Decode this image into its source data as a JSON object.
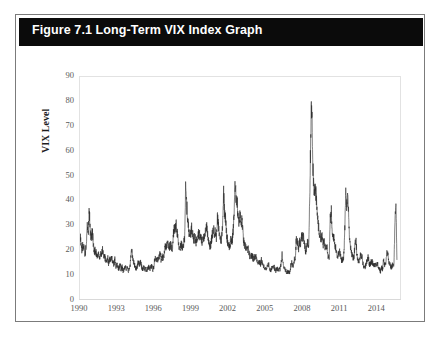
{
  "figure": {
    "title": "Figure 7.1 Long-Term VIX Index Graph",
    "frame_border_color": "#7b7b7b",
    "title_bar_color": "#0b0b0b",
    "title_text_color": "#ffffff",
    "background_color": "#ffffff"
  },
  "chart_data": {
    "type": "line",
    "title": "Figure 7.1 Long-Term VIX Index Graph",
    "xlabel": "",
    "ylabel": "VIX Level",
    "xlim": [
      1990,
      2016
    ],
    "ylim": [
      0,
      90
    ],
    "ytick_labels": [
      "90",
      "80",
      "70",
      "60",
      "50",
      "40",
      "30",
      "20",
      "10",
      "0"
    ],
    "ytick_values": [
      90,
      80,
      70,
      60,
      50,
      40,
      30,
      20,
      10,
      0
    ],
    "xtick_labels": [
      "1990",
      "1993",
      "1996",
      "1999",
      "2002",
      "2005",
      "2008",
      "2011",
      "2014"
    ],
    "xtick_values": [
      1990,
      1993,
      1996,
      1999,
      2002,
      2005,
      2008,
      2011,
      2014
    ],
    "grid": false,
    "legend": null,
    "series_name": "VIX Level",
    "line_color": "#2b2b2b",
    "line_width": 0.6,
    "x": [
      1990.0,
      1990.08,
      1990.17,
      1990.25,
      1990.33,
      1990.42,
      1990.5,
      1990.58,
      1990.67,
      1990.75,
      1990.83,
      1990.92,
      1991.0,
      1991.08,
      1991.17,
      1991.25,
      1991.33,
      1991.42,
      1991.5,
      1991.58,
      1991.67,
      1991.75,
      1991.83,
      1991.92,
      1992.0,
      1992.08,
      1992.17,
      1992.25,
      1992.33,
      1992.42,
      1992.5,
      1992.58,
      1992.67,
      1992.75,
      1992.83,
      1992.92,
      1993.0,
      1993.08,
      1993.17,
      1993.25,
      1993.33,
      1993.42,
      1993.5,
      1993.58,
      1993.67,
      1993.75,
      1993.83,
      1993.92,
      1994.0,
      1994.08,
      1994.17,
      1994.25,
      1994.33,
      1994.42,
      1994.5,
      1994.58,
      1994.67,
      1994.75,
      1994.83,
      1994.92,
      1995.0,
      1995.08,
      1995.17,
      1995.25,
      1995.33,
      1995.42,
      1995.5,
      1995.58,
      1995.67,
      1995.75,
      1995.83,
      1995.92,
      1996.0,
      1996.08,
      1996.17,
      1996.25,
      1996.33,
      1996.42,
      1996.5,
      1996.58,
      1996.67,
      1996.75,
      1996.83,
      1996.92,
      1997.0,
      1997.08,
      1997.17,
      1997.25,
      1997.33,
      1997.42,
      1997.5,
      1997.58,
      1997.67,
      1997.75,
      1997.83,
      1997.92,
      1998.0,
      1998.08,
      1998.17,
      1998.25,
      1998.33,
      1998.42,
      1998.5,
      1998.58,
      1998.67,
      1998.75,
      1998.83,
      1998.92,
      1999.0,
      1999.08,
      1999.17,
      1999.25,
      1999.33,
      1999.42,
      1999.5,
      1999.58,
      1999.67,
      1999.75,
      1999.83,
      1999.92,
      2000.0,
      2000.08,
      2000.17,
      2000.25,
      2000.33,
      2000.42,
      2000.5,
      2000.58,
      2000.67,
      2000.75,
      2000.83,
      2000.92,
      2001.0,
      2001.08,
      2001.17,
      2001.25,
      2001.33,
      2001.42,
      2001.5,
      2001.58,
      2001.67,
      2001.75,
      2001.83,
      2001.92,
      2002.0,
      2002.08,
      2002.17,
      2002.25,
      2002.33,
      2002.42,
      2002.5,
      2002.58,
      2002.67,
      2002.75,
      2002.83,
      2002.92,
      2003.0,
      2003.08,
      2003.17,
      2003.25,
      2003.33,
      2003.42,
      2003.5,
      2003.58,
      2003.67,
      2003.75,
      2003.83,
      2003.92,
      2004.0,
      2004.08,
      2004.17,
      2004.25,
      2004.33,
      2004.42,
      2004.5,
      2004.58,
      2004.67,
      2004.75,
      2004.83,
      2004.92,
      2005.0,
      2005.08,
      2005.17,
      2005.25,
      2005.33,
      2005.42,
      2005.5,
      2005.58,
      2005.67,
      2005.75,
      2005.83,
      2005.92,
      2006.0,
      2006.08,
      2006.17,
      2006.25,
      2006.33,
      2006.42,
      2006.5,
      2006.58,
      2006.67,
      2006.75,
      2006.83,
      2006.92,
      2007.0,
      2007.08,
      2007.17,
      2007.25,
      2007.33,
      2007.42,
      2007.5,
      2007.58,
      2007.67,
      2007.75,
      2007.83,
      2007.92,
      2008.0,
      2008.08,
      2008.17,
      2008.25,
      2008.33,
      2008.42,
      2008.5,
      2008.58,
      2008.67,
      2008.75,
      2008.83,
      2008.92,
      2009.0,
      2009.08,
      2009.17,
      2009.25,
      2009.33,
      2009.42,
      2009.5,
      2009.58,
      2009.67,
      2009.75,
      2009.83,
      2009.92,
      2010.0,
      2010.08,
      2010.17,
      2010.25,
      2010.33,
      2010.42,
      2010.5,
      2010.58,
      2010.67,
      2010.75,
      2010.83,
      2010.92,
      2011.0,
      2011.08,
      2011.17,
      2011.25,
      2011.33,
      2011.42,
      2011.5,
      2011.58,
      2011.67,
      2011.75,
      2011.83,
      2011.92,
      2012.0,
      2012.08,
      2012.17,
      2012.25,
      2012.33,
      2012.42,
      2012.5,
      2012.58,
      2012.67,
      2012.75,
      2012.83,
      2012.92,
      2013.0,
      2013.08,
      2013.17,
      2013.25,
      2013.33,
      2013.42,
      2013.5,
      2013.58,
      2013.67,
      2013.75,
      2013.83,
      2013.92,
      2014.0,
      2014.08,
      2014.17,
      2014.25,
      2014.33,
      2014.42,
      2014.5,
      2014.58,
      2014.67,
      2014.75,
      2014.83,
      2014.92,
      2015.0,
      2015.08,
      2015.17,
      2015.25,
      2015.33,
      2015.42,
      2015.5,
      2015.58,
      2015.67,
      2015.75
    ],
    "values": [
      26,
      22,
      19,
      23,
      20,
      18,
      22,
      30,
      27,
      36,
      28,
      24,
      28,
      22,
      19,
      20,
      18,
      17,
      18,
      16,
      19,
      18,
      20,
      17,
      17,
      16,
      15,
      17,
      14,
      16,
      15,
      17,
      15,
      14,
      16,
      13,
      14,
      13,
      12,
      14,
      12,
      13,
      11,
      12,
      13,
      12,
      13,
      11,
      12,
      14,
      20,
      18,
      15,
      14,
      13,
      12,
      14,
      15,
      14,
      15,
      13,
      12,
      13,
      12,
      12,
      12,
      12,
      13,
      12,
      13,
      13,
      12,
      13,
      17,
      15,
      16,
      16,
      17,
      18,
      16,
      17,
      16,
      18,
      21,
      21,
      22,
      23,
      21,
      22,
      21,
      20,
      26,
      29,
      28,
      30,
      26,
      22,
      20,
      21,
      22,
      20,
      22,
      25,
      44,
      38,
      32,
      28,
      26,
      27,
      29,
      26,
      24,
      25,
      23,
      24,
      26,
      27,
      25,
      25,
      22,
      26,
      24,
      26,
      30,
      28,
      24,
      23,
      21,
      23,
      26,
      28,
      27,
      27,
      25,
      33,
      29,
      26,
      24,
      24,
      30,
      43,
      36,
      32,
      26,
      23,
      22,
      21,
      24,
      23,
      26,
      32,
      45,
      42,
      40,
      35,
      31,
      34,
      30,
      32,
      26,
      22,
      21,
      21,
      20,
      20,
      18,
      17,
      17,
      18,
      16,
      17,
      17,
      17,
      15,
      15,
      15,
      14,
      16,
      14,
      13,
      13,
      12,
      12,
      14,
      14,
      12,
      11,
      13,
      13,
      14,
      12,
      11,
      12,
      12,
      12,
      12,
      14,
      18,
      14,
      13,
      12,
      11,
      11,
      11,
      11,
      11,
      15,
      14,
      13,
      16,
      17,
      25,
      23,
      20,
      23,
      22,
      26,
      25,
      25,
      22,
      19,
      21,
      23,
      21,
      40,
      67,
      81,
      55,
      45,
      45,
      42,
      36,
      32,
      27,
      26,
      25,
      25,
      22,
      23,
      21,
      22,
      21,
      17,
      17,
      32,
      35,
      25,
      26,
      23,
      21,
      20,
      17,
      18,
      19,
      18,
      15,
      16,
      17,
      25,
      43,
      38,
      45,
      33,
      23,
      20,
      18,
      17,
      17,
      21,
      24,
      18,
      16,
      14,
      17,
      18,
      17,
      14,
      13,
      13,
      14,
      16,
      17,
      14,
      14,
      15,
      15,
      14,
      14,
      14,
      14,
      14,
      13,
      12,
      11,
      13,
      12,
      16,
      14,
      14,
      18,
      20,
      15,
      14,
      13,
      13,
      14,
      13,
      28,
      40,
      16
    ]
  }
}
